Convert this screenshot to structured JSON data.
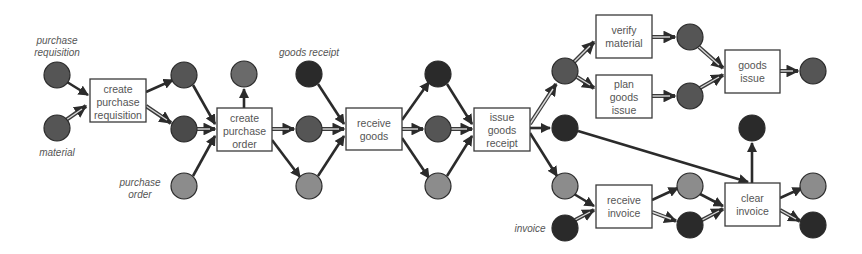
{
  "diagram": {
    "type": "petri-net-process",
    "colors": {
      "place_dark": "#2f2f2f",
      "place_mid": "#555555",
      "place_light": "#8c8c8c",
      "box_border": "#3a3a3a",
      "text": "#555555"
    },
    "annotations": [
      {
        "id": "ann-purchase-requisition",
        "lines": [
          "purchase",
          "requisition"
        ]
      },
      {
        "id": "ann-material",
        "lines": [
          "material"
        ]
      },
      {
        "id": "ann-purchase-order",
        "lines": [
          "purchase",
          "order"
        ]
      },
      {
        "id": "ann-goods-receipt",
        "lines": [
          "goods receipt"
        ]
      },
      {
        "id": "ann-invoice",
        "lines": [
          "invoice"
        ]
      }
    ],
    "transitions": [
      {
        "id": "create-purchase-requisition",
        "lines": [
          "create",
          "purchase",
          "requisition"
        ]
      },
      {
        "id": "create-purchase-order",
        "lines": [
          "create",
          "purchase",
          "order"
        ]
      },
      {
        "id": "receive-goods",
        "lines": [
          "receive",
          "goods"
        ]
      },
      {
        "id": "issue-goods-receipt",
        "lines": [
          "issue",
          "goods",
          "receipt"
        ]
      },
      {
        "id": "verify-material",
        "lines": [
          "verify",
          "material"
        ]
      },
      {
        "id": "plan-goods-issue",
        "lines": [
          "plan",
          "goods",
          "issue"
        ]
      },
      {
        "id": "goods-issue",
        "lines": [
          "goods",
          "issue"
        ]
      },
      {
        "id": "receive-invoice",
        "lines": [
          "receive",
          "invoice"
        ]
      },
      {
        "id": "clear-invoice",
        "lines": [
          "clear",
          "invoice"
        ]
      }
    ]
  }
}
